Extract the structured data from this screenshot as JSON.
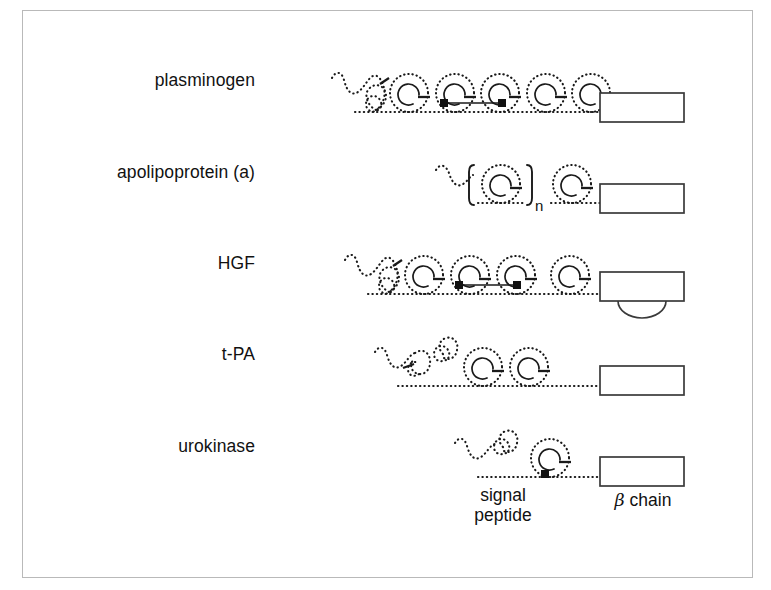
{
  "figure": {
    "type": "protein-domain-architecture-diagram",
    "background": "#ffffff",
    "frame_color": "#b9b9b9",
    "line_color": "#1a1a1a"
  },
  "rows": [
    {
      "id": "plasminogen",
      "label": "plasminogen",
      "kringle_count": 5,
      "has_signal_peptide": true,
      "has_finger_domain": false,
      "has_egf_domain": true,
      "disulfide_bonds": 1,
      "bracketed_repeat": false,
      "beta_chain_box": true,
      "box_bulge": false
    },
    {
      "id": "apolipoprotein-a",
      "label": "apolipoprotein (a)",
      "kringle_count": 2,
      "has_signal_peptide": true,
      "has_finger_domain": false,
      "has_egf_domain": false,
      "disulfide_bonds": 0,
      "bracketed_repeat": true,
      "repeat_subscript": "n",
      "beta_chain_box": true,
      "box_bulge": false
    },
    {
      "id": "hgf",
      "label": "HGF",
      "kringle_count": 4,
      "has_signal_peptide": true,
      "has_finger_domain": false,
      "has_egf_domain": true,
      "disulfide_bonds": 1,
      "bracketed_repeat": false,
      "beta_chain_box": true,
      "box_bulge": true
    },
    {
      "id": "t-pa",
      "label": "t-PA",
      "kringle_count": 2,
      "has_signal_peptide": true,
      "has_finger_domain": true,
      "has_egf_domain": true,
      "disulfide_bonds": 0,
      "bracketed_repeat": false,
      "beta_chain_box": true,
      "box_bulge": false
    },
    {
      "id": "urokinase",
      "label": "urokinase",
      "kringle_count": 1,
      "has_signal_peptide": true,
      "has_finger_domain": false,
      "has_egf_domain": true,
      "disulfide_bonds": 0,
      "bracketed_repeat": false,
      "beta_chain_box": true,
      "box_bulge": false
    }
  ],
  "captions": {
    "signal_peptide_line1": "signal",
    "signal_peptide_line2": "peptide",
    "beta_chain_symbol": "β",
    "beta_chain_text": " chain"
  }
}
